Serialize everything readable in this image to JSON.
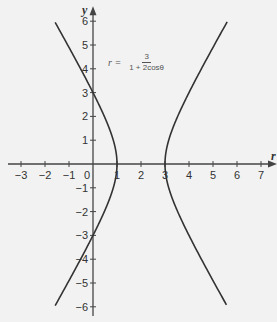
{
  "chart_data": {
    "type": "line",
    "title": "",
    "equation": {
      "lhs": "r =",
      "numerator": "3",
      "denominator": "1 + 2cosθ"
    },
    "xlabel": "r",
    "ylabel": "y",
    "xlim": [
      -3,
      7
    ],
    "ylim": [
      -6,
      6
    ],
    "x_ticks": [
      "-3",
      "-2",
      "-1",
      "0",
      "1",
      "2",
      "3",
      "4",
      "5",
      "6",
      "7"
    ],
    "y_ticks": [
      "6",
      "5",
      "4",
      "3",
      "2",
      "1",
      "-1",
      "-2",
      "-3",
      "-4",
      "-5",
      "-6"
    ],
    "grid": false,
    "series": [
      {
        "name": "left branch (hyperbola)",
        "vertex": [
          1,
          0
        ],
        "points": [
          [
            -1.8,
            6
          ],
          [
            -0.3,
            3.6
          ],
          [
            0,
            3
          ],
          [
            0.6,
            1.8
          ],
          [
            1,
            0
          ],
          [
            0.6,
            -1.8
          ],
          [
            0,
            -3
          ],
          [
            -0.3,
            -3.6
          ],
          [
            -1.8,
            -6
          ]
        ]
      },
      {
        "name": "right branch (hyperbola)",
        "vertex": [
          3,
          0
        ],
        "points": [
          [
            5.8,
            6
          ],
          [
            4.3,
            3.6
          ],
          [
            3.6,
            1.8
          ],
          [
            3,
            0
          ],
          [
            3.6,
            -1.8
          ],
          [
            4.3,
            -3.6
          ],
          [
            5.8,
            -6
          ]
        ]
      }
    ],
    "colors": {
      "curve": "#333333",
      "axes": "#444444"
    }
  }
}
